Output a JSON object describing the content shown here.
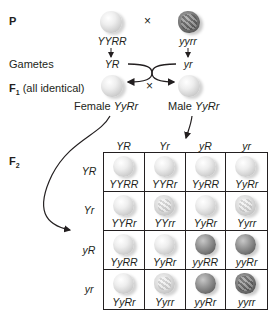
{
  "generations": {
    "p_label": "P",
    "gametes_label": "Gametes",
    "f1_label_main": "F",
    "f1_label_sub": "1",
    "f1_note": " (all identical)",
    "f2_label_main": "F",
    "f2_label_sub": "2"
  },
  "parents": {
    "cross_symbol": "×",
    "left": {
      "genotype": "YYRR",
      "phenotype": "yellow-round",
      "gamete": "YR"
    },
    "right": {
      "genotype": "yyrr",
      "phenotype": "green-wrinkled",
      "gamete": "yr"
    }
  },
  "f1": {
    "cross_symbol": "×",
    "female": {
      "prefix": "Female ",
      "genotype": "YyRr",
      "phenotype": "yellow-round"
    },
    "male": {
      "prefix": "Male ",
      "genotype": "YyRr",
      "phenotype": "yellow-round"
    }
  },
  "punnett": {
    "column_headers": [
      "YR",
      "Yr",
      "yR",
      "yr"
    ],
    "row_headers": [
      "YR",
      "Yr",
      "yR",
      "yr"
    ],
    "rows": [
      [
        {
          "genotype": "YYRR",
          "phenotype": "yellow-round"
        },
        {
          "genotype": "YYRr",
          "phenotype": "yellow-round"
        },
        {
          "genotype": "YyRR",
          "phenotype": "yellow-round"
        },
        {
          "genotype": "YyRr",
          "phenotype": "yellow-round"
        }
      ],
      [
        {
          "genotype": "YYRr",
          "phenotype": "yellow-round"
        },
        {
          "genotype": "YYrr",
          "phenotype": "yellow-wrinkled"
        },
        {
          "genotype": "YyRr",
          "phenotype": "yellow-round"
        },
        {
          "genotype": "Yyrr",
          "phenotype": "yellow-wrinkled"
        }
      ],
      [
        {
          "genotype": "YyRR",
          "phenotype": "yellow-round"
        },
        {
          "genotype": "YyRr",
          "phenotype": "yellow-round"
        },
        {
          "genotype": "yyRR",
          "phenotype": "green-round"
        },
        {
          "genotype": "yyRr",
          "phenotype": "green-round"
        }
      ],
      [
        {
          "genotype": "YyRr",
          "phenotype": "yellow-round"
        },
        {
          "genotype": "Yyrr",
          "phenotype": "yellow-wrinkled"
        },
        {
          "genotype": "yyRr",
          "phenotype": "green-round"
        },
        {
          "genotype": "yyrr",
          "phenotype": "green-wrinkled"
        }
      ]
    ]
  }
}
